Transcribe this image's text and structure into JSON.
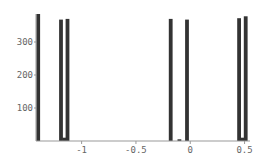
{
  "chart_data": {
    "type": "bar",
    "title": "",
    "xlabel": "",
    "ylabel": "",
    "xlim": [
      -1.42,
      0.55
    ],
    "ylim": [
      0,
      400
    ],
    "grid": false,
    "legend": null,
    "x_ticks": [
      {
        "value": -1,
        "label": "-1"
      },
      {
        "value": -0.5,
        "label": "-0.5"
      },
      {
        "value": 0,
        "label": "0"
      },
      {
        "value": 0.5,
        "label": "0.5"
      }
    ],
    "y_ticks": [
      {
        "value": 100,
        "label": "100"
      },
      {
        "value": 200,
        "label": "200"
      },
      {
        "value": 300,
        "label": "300"
      }
    ],
    "bar_width": 0.035,
    "bar_color": "#333333",
    "bars": [
      {
        "x": -1.4,
        "value": 385
      },
      {
        "x": -1.19,
        "value": 368
      },
      {
        "x": -1.13,
        "value": 370
      },
      {
        "x": -1.16,
        "value": 10
      },
      {
        "x": -0.18,
        "value": 370
      },
      {
        "x": -0.1,
        "value": 5
      },
      {
        "x": -0.03,
        "value": 368
      },
      {
        "x": 0.45,
        "value": 372
      },
      {
        "x": 0.48,
        "value": 10
      },
      {
        "x": 0.51,
        "value": 378
      }
    ]
  }
}
